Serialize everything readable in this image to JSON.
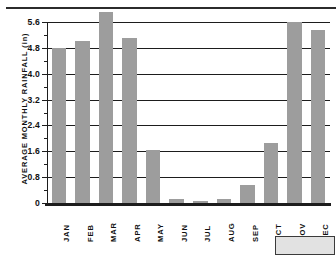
{
  "figure": {
    "top_rule": "",
    "corner_box_label": ""
  },
  "chart_data": {
    "type": "bar",
    "title": "",
    "xlabel": "",
    "ylabel": "AVERAGE MONTHLY RAINFALL (in)",
    "categories": [
      "JAN",
      "FEB",
      "MAR",
      "APR",
      "MAY",
      "JUN",
      "JUL",
      "AUG",
      "SEP",
      "OCT",
      "NOV",
      "DEC"
    ],
    "values": [
      4.8,
      5.0,
      5.9,
      5.1,
      1.65,
      0.12,
      0.05,
      0.12,
      0.55,
      1.85,
      5.6,
      5.35
    ],
    "ylim": [
      0,
      5.6
    ],
    "ytick_labels": [
      "0",
      "0.8",
      "1.6",
      "2.4",
      "3.2",
      "4.0",
      "4.8",
      "5.6"
    ],
    "ytick_values": [
      0,
      0.8,
      1.6,
      2.4,
      3.2,
      4.0,
      4.8,
      5.6
    ],
    "minor_tick_values": [
      0.4,
      1.2,
      2.0,
      2.8,
      3.6,
      4.4,
      5.2
    ],
    "grid": true,
    "legend": false,
    "bar_color": "#9d9d9d",
    "axis_color": "#1d1d1d"
  }
}
